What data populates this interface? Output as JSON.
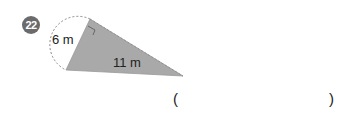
{
  "problem": {
    "number": "22",
    "labels": {
      "side_short": "6 m",
      "side_long": "11 m"
    },
    "answer": {
      "open": "(",
      "close": ")",
      "value": ""
    }
  },
  "colors": {
    "fill": "#a9a9a9",
    "badge": "#6b6b6b"
  }
}
